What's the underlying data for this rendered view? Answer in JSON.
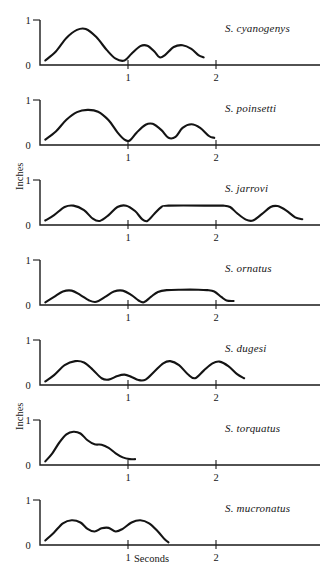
{
  "figure": {
    "axis_titles": {
      "y": "Inches",
      "x": "Seconds"
    },
    "y_ticks": [
      "1",
      "0"
    ],
    "x_ticks": [
      "1",
      "2"
    ]
  },
  "chart_data": {
    "type": "line",
    "title": "",
    "xlabel": "Seconds",
    "ylabel": "Inches",
    "xlim": [
      0,
      3.2
    ],
    "ylim": [
      0,
      1
    ],
    "grid": false,
    "legend": "none",
    "x_tick_values": [
      1,
      2
    ],
    "y_tick_values": [
      0,
      1
    ],
    "panels": [
      {
        "name": "S. cyanogenys",
        "description": "One large bob then two smaller bobs, ending before 1.6 s",
        "points": [
          [
            0.06,
            0.1
          ],
          [
            0.18,
            0.3
          ],
          [
            0.3,
            0.6
          ],
          [
            0.42,
            0.78
          ],
          [
            0.52,
            0.8
          ],
          [
            0.64,
            0.62
          ],
          [
            0.76,
            0.33
          ],
          [
            0.86,
            0.14
          ],
          [
            0.96,
            0.1
          ],
          [
            1.04,
            0.25
          ],
          [
            1.14,
            0.42
          ],
          [
            1.22,
            0.43
          ],
          [
            1.3,
            0.3
          ],
          [
            1.36,
            0.17
          ],
          [
            1.42,
            0.22
          ],
          [
            1.52,
            0.4
          ],
          [
            1.62,
            0.44
          ],
          [
            1.72,
            0.36
          ],
          [
            1.8,
            0.22
          ],
          [
            1.86,
            0.17
          ]
        ]
      },
      {
        "name": "S. poinsetti",
        "description": "One broad tall bob then two equal smaller bobs, ending near 1.8 s",
        "points": [
          [
            0.06,
            0.12
          ],
          [
            0.18,
            0.3
          ],
          [
            0.3,
            0.56
          ],
          [
            0.42,
            0.73
          ],
          [
            0.54,
            0.78
          ],
          [
            0.66,
            0.74
          ],
          [
            0.78,
            0.55
          ],
          [
            0.88,
            0.28
          ],
          [
            0.96,
            0.12
          ],
          [
            1.02,
            0.1
          ],
          [
            1.1,
            0.28
          ],
          [
            1.2,
            0.45
          ],
          [
            1.28,
            0.47
          ],
          [
            1.38,
            0.33
          ],
          [
            1.46,
            0.16
          ],
          [
            1.54,
            0.18
          ],
          [
            1.62,
            0.38
          ],
          [
            1.72,
            0.46
          ],
          [
            1.82,
            0.38
          ],
          [
            1.92,
            0.2
          ],
          [
            1.98,
            0.16
          ]
        ]
      },
      {
        "name": "S. jarrovi",
        "description": "Two bobs, a long plateau from ~1.2 to ~2.1 s, then two more bobs",
        "points": [
          [
            0.06,
            0.1
          ],
          [
            0.16,
            0.22
          ],
          [
            0.28,
            0.4
          ],
          [
            0.38,
            0.43
          ],
          [
            0.5,
            0.33
          ],
          [
            0.6,
            0.14
          ],
          [
            0.68,
            0.09
          ],
          [
            0.78,
            0.22
          ],
          [
            0.88,
            0.4
          ],
          [
            0.98,
            0.43
          ],
          [
            1.08,
            0.31
          ],
          [
            1.16,
            0.13
          ],
          [
            1.22,
            0.09
          ],
          [
            1.3,
            0.25
          ],
          [
            1.38,
            0.4
          ],
          [
            1.46,
            0.43
          ],
          [
            2.0,
            0.43
          ],
          [
            2.08,
            0.43
          ],
          [
            2.16,
            0.4
          ],
          [
            2.24,
            0.26
          ],
          [
            2.34,
            0.12
          ],
          [
            2.42,
            0.1
          ],
          [
            2.52,
            0.24
          ],
          [
            2.62,
            0.4
          ],
          [
            2.7,
            0.42
          ],
          [
            2.8,
            0.32
          ],
          [
            2.9,
            0.17
          ],
          [
            2.98,
            0.13
          ]
        ]
      },
      {
        "name": "S. ornatus",
        "description": "Two low bobs then a long low plateau ending with a tick mark at ~2.1 s",
        "points": [
          [
            0.06,
            0.06
          ],
          [
            0.16,
            0.18
          ],
          [
            0.26,
            0.3
          ],
          [
            0.36,
            0.32
          ],
          [
            0.46,
            0.22
          ],
          [
            0.56,
            0.1
          ],
          [
            0.64,
            0.07
          ],
          [
            0.74,
            0.18
          ],
          [
            0.84,
            0.3
          ],
          [
            0.94,
            0.32
          ],
          [
            1.04,
            0.22
          ],
          [
            1.12,
            0.1
          ],
          [
            1.18,
            0.06
          ],
          [
            1.26,
            0.18
          ],
          [
            1.34,
            0.29
          ],
          [
            1.44,
            0.33
          ],
          [
            1.6,
            0.34
          ],
          [
            1.8,
            0.34
          ],
          [
            1.9,
            0.33
          ],
          [
            1.98,
            0.3
          ],
          [
            2.06,
            0.18
          ],
          [
            2.12,
            0.1
          ],
          [
            2.2,
            0.09
          ]
        ]
      },
      {
        "name": "S. dugesi",
        "description": "Tall bob, a small low bob, then two tall bobs ending at ~2.05 s",
        "points": [
          [
            0.06,
            0.08
          ],
          [
            0.16,
            0.22
          ],
          [
            0.28,
            0.44
          ],
          [
            0.4,
            0.53
          ],
          [
            0.5,
            0.5
          ],
          [
            0.6,
            0.34
          ],
          [
            0.7,
            0.15
          ],
          [
            0.78,
            0.12
          ],
          [
            0.88,
            0.2
          ],
          [
            0.96,
            0.23
          ],
          [
            1.04,
            0.18
          ],
          [
            1.12,
            0.11
          ],
          [
            1.2,
            0.12
          ],
          [
            1.3,
            0.3
          ],
          [
            1.4,
            0.48
          ],
          [
            1.48,
            0.53
          ],
          [
            1.58,
            0.44
          ],
          [
            1.68,
            0.24
          ],
          [
            1.76,
            0.15
          ],
          [
            1.86,
            0.32
          ],
          [
            1.96,
            0.48
          ],
          [
            2.04,
            0.52
          ],
          [
            2.14,
            0.42
          ],
          [
            2.24,
            0.24
          ],
          [
            2.32,
            0.15
          ]
        ]
      },
      {
        "name": "S. torquatus",
        "description": "Single tall bob with a shoulder, decaying to baseline before 1 s",
        "points": [
          [
            0.06,
            0.08
          ],
          [
            0.14,
            0.26
          ],
          [
            0.22,
            0.5
          ],
          [
            0.3,
            0.68
          ],
          [
            0.38,
            0.74
          ],
          [
            0.46,
            0.7
          ],
          [
            0.54,
            0.55
          ],
          [
            0.62,
            0.46
          ],
          [
            0.7,
            0.45
          ],
          [
            0.78,
            0.38
          ],
          [
            0.86,
            0.26
          ],
          [
            0.94,
            0.17
          ],
          [
            1.02,
            0.13
          ],
          [
            1.08,
            0.13
          ]
        ]
      },
      {
        "name": "S. mucronatus",
        "description": "Bob, small middle bob, second bob, dropping sharply at 1 s",
        "points": [
          [
            0.06,
            0.1
          ],
          [
            0.16,
            0.28
          ],
          [
            0.26,
            0.48
          ],
          [
            0.36,
            0.55
          ],
          [
            0.46,
            0.5
          ],
          [
            0.54,
            0.36
          ],
          [
            0.62,
            0.3
          ],
          [
            0.7,
            0.37
          ],
          [
            0.78,
            0.38
          ],
          [
            0.86,
            0.3
          ],
          [
            0.94,
            0.36
          ],
          [
            1.04,
            0.5
          ],
          [
            1.14,
            0.55
          ],
          [
            1.24,
            0.48
          ],
          [
            1.34,
            0.3
          ],
          [
            1.42,
            0.12
          ],
          [
            1.46,
            0.06
          ]
        ]
      }
    ]
  }
}
